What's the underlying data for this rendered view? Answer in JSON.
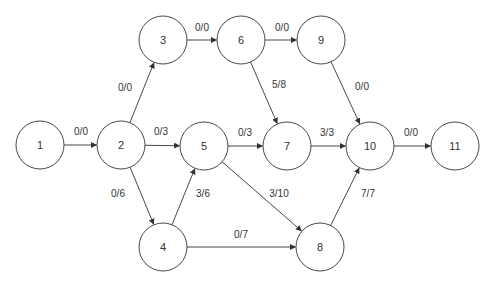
{
  "diagram": {
    "type": "flow-network",
    "node_radius": 24,
    "stroke_color": "#333333",
    "background": "#ffffff",
    "nodes": [
      {
        "id": "1",
        "label": "1",
        "x": 40,
        "y": 145
      },
      {
        "id": "2",
        "label": "2",
        "x": 121,
        "y": 145
      },
      {
        "id": "3",
        "label": "3",
        "x": 163,
        "y": 40
      },
      {
        "id": "4",
        "label": "4",
        "x": 163,
        "y": 247
      },
      {
        "id": "5",
        "label": "5",
        "x": 204,
        "y": 146
      },
      {
        "id": "6",
        "label": "6",
        "x": 241,
        "y": 40
      },
      {
        "id": "7",
        "label": "7",
        "x": 287,
        "y": 146
      },
      {
        "id": "8",
        "label": "8",
        "x": 320,
        "y": 247
      },
      {
        "id": "9",
        "label": "9",
        "x": 321,
        "y": 40
      },
      {
        "id": "10",
        "label": "10",
        "x": 370,
        "y": 146
      },
      {
        "id": "11",
        "label": "11",
        "x": 455,
        "y": 146
      }
    ],
    "edges": [
      {
        "from": "1",
        "to": "2",
        "label": "0/0",
        "lx": 81,
        "ly": 135
      },
      {
        "from": "2",
        "to": "3",
        "label": "0/0",
        "lx": 125,
        "ly": 91
      },
      {
        "from": "2",
        "to": "5",
        "label": "0/3",
        "lx": 161,
        "ly": 135
      },
      {
        "from": "2",
        "to": "4",
        "label": "0/6",
        "lx": 118,
        "ly": 197
      },
      {
        "from": "3",
        "to": "6",
        "label": "0/0",
        "lx": 202,
        "ly": 31
      },
      {
        "from": "4",
        "to": "5",
        "label": "3/6",
        "lx": 203,
        "ly": 197
      },
      {
        "from": "4",
        "to": "8",
        "label": "0/7",
        "lx": 241,
        "ly": 238
      },
      {
        "from": "5",
        "to": "7",
        "label": "0/3",
        "lx": 245,
        "ly": 136
      },
      {
        "from": "5",
        "to": "8",
        "label": "3/10",
        "lx": 279,
        "ly": 197
      },
      {
        "from": "6",
        "to": "9",
        "label": "0/0",
        "lx": 282,
        "ly": 31
      },
      {
        "from": "6",
        "to": "7",
        "label": "5/8",
        "lx": 279,
        "ly": 88
      },
      {
        "from": "7",
        "to": "10",
        "label": "3/3",
        "lx": 327,
        "ly": 136
      },
      {
        "from": "9",
        "to": "10",
        "label": "0/0",
        "lx": 362,
        "ly": 90
      },
      {
        "from": "8",
        "to": "10",
        "label": "7/7",
        "lx": 368,
        "ly": 197
      },
      {
        "from": "10",
        "to": "11",
        "label": "0/0",
        "lx": 411,
        "ly": 136
      }
    ]
  }
}
